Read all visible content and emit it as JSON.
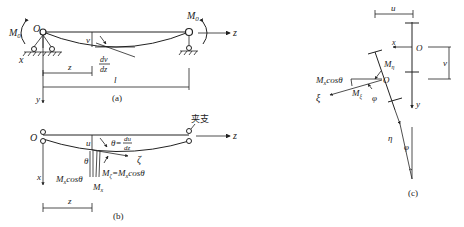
{
  "figure_a": {
    "caption": "(a)",
    "labels": {
      "moment_left": "M",
      "moment_left_sub": "0",
      "moment_right": "M",
      "moment_right_sub": "0",
      "origin": "O",
      "axis_z": "z",
      "axis_x": "x",
      "axis_y": "y",
      "deflection": "v",
      "slope_num": "dv",
      "slope_den": "dz",
      "dim_z": "z",
      "dim_l": "l"
    }
  },
  "figure_b": {
    "caption": "(b)",
    "labels": {
      "origin": "O",
      "support": "夹支",
      "axis_z": "z",
      "axis_x": "x",
      "deflection": "u",
      "theta_eq": "θ=",
      "slope_num": "du",
      "slope_den": "dz",
      "zeta": "ζ",
      "theta": "θ",
      "mx_cos": "M",
      "mx_cos_sub": "x",
      "mx_cos_tail": "cosθ",
      "mzeta": "M",
      "mzeta_sub": "ζ",
      "mzeta_eq": "=M",
      "mzeta_eq_sub": "x",
      "mzeta_tail": "cosθ",
      "mx": "M",
      "mx_sub": "x",
      "dim_z": "z"
    }
  },
  "figure_c": {
    "caption": "(c)",
    "labels": {
      "dim_u": "u",
      "axis_x": "x",
      "origin_top": "O",
      "dim_v": "v",
      "axis_y": "y",
      "m_eta": "M",
      "m_eta_sub": "η",
      "origin_bottom": "O",
      "mx_cos": "M",
      "mx_cos_sub": "x",
      "mx_cos_tail": "cosθ",
      "xi": "ξ",
      "m_xi": "M",
      "m_xi_sub": "ξ",
      "phi": "φ",
      "eta": "η",
      "phi2": "φ"
    }
  }
}
